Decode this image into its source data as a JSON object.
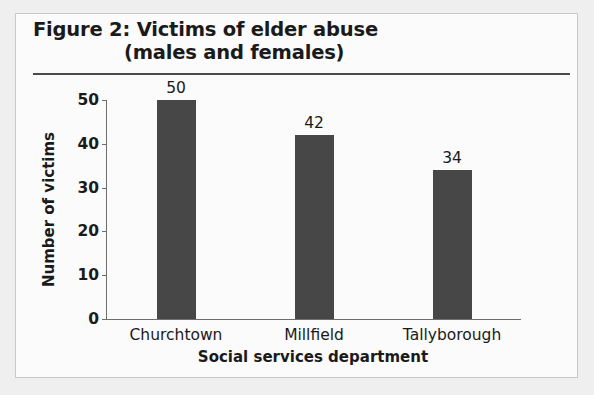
{
  "figure": {
    "title_line_1": "Figure 2: Victims of elder abuse",
    "title_line_2": "(males and females)"
  },
  "chart_data": {
    "type": "bar",
    "title": "Figure 2: Victims of elder abuse (males and females)",
    "categories": [
      "Churchtown",
      "Millfield",
      "Tallyborough"
    ],
    "values": [
      50,
      42,
      34
    ],
    "value_labels": [
      "50",
      "42",
      "34"
    ],
    "xlabel": "Social services department",
    "ylabel": "Number of victims",
    "ylim": [
      0,
      50
    ],
    "yticks": [
      0,
      10,
      20,
      30,
      40,
      50
    ],
    "ytick_labels": [
      "0",
      "10",
      "20",
      "30",
      "40",
      "50"
    ],
    "grid": false,
    "legend": false,
    "bar_color": "#474747",
    "axis_color": "#6e6e6e",
    "text_color": "#1a1a1a",
    "background_color": "#fbfbfb"
  }
}
